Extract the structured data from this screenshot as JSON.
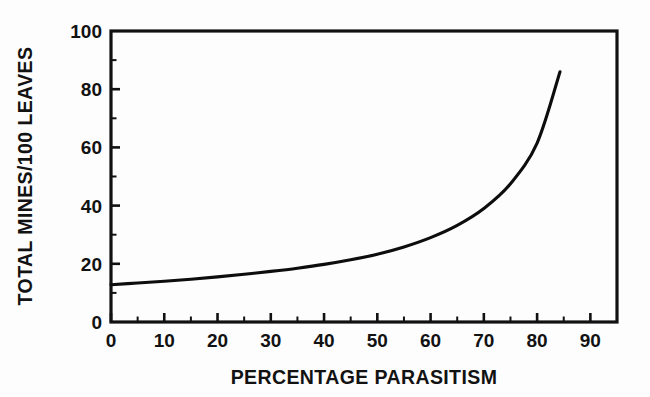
{
  "figure": {
    "background_color": "#fdfdfd",
    "ink_color": "#111111"
  },
  "chart_data": {
    "type": "line",
    "title": "",
    "subtitle": "",
    "xlabel": "PERCENTAGE PARASITISM",
    "ylabel": "TOTAL MINES/100 LEAVES",
    "xlim": [
      0,
      95
    ],
    "ylim": [
      0,
      100
    ],
    "grid": false,
    "legend": null,
    "legend_position": "none",
    "x_major_ticks": [
      0,
      10,
      20,
      30,
      40,
      50,
      60,
      70,
      80,
      90
    ],
    "x_major_tick_labels": [
      "0",
      "10",
      "20",
      "30",
      "40",
      "50",
      "60",
      "70",
      "80",
      "90"
    ],
    "x_minor_tick_step": 5,
    "y_major_ticks": [
      0,
      20,
      40,
      60,
      80,
      100
    ],
    "y_major_tick_labels": [
      "0",
      "20",
      "40",
      "60",
      "80",
      "100"
    ],
    "y_minor_tick_step": 10,
    "tick_direction": "in",
    "series": [
      {
        "name": "Total mines per 100 leaves vs percentage parasitism",
        "color": "#0d0d0d",
        "line_width": 3.1,
        "x": [
          0,
          5,
          10,
          15,
          20,
          25,
          30,
          35,
          40,
          45,
          50,
          55,
          60,
          65,
          70,
          75,
          80,
          84.3
        ],
        "y": [
          12.8,
          13.4,
          14.0,
          14.7,
          15.5,
          16.4,
          17.4,
          18.5,
          19.8,
          21.4,
          23.3,
          25.8,
          29.0,
          33.2,
          39.0,
          47.5,
          61.5,
          86.0
        ]
      }
    ],
    "annotations": []
  }
}
